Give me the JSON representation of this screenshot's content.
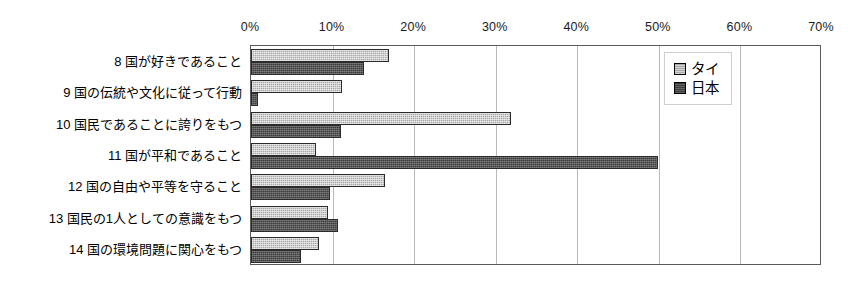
{
  "chart_data": {
    "type": "bar",
    "orientation": "horizontal",
    "title": "",
    "xlabel": "",
    "ylabel": "",
    "xlim": [
      0,
      70
    ],
    "xticks": [
      0,
      10,
      20,
      30,
      40,
      50,
      60,
      70
    ],
    "xtick_labels": [
      "0%",
      "10%",
      "20%",
      "30%",
      "40%",
      "50%",
      "60%",
      "70%"
    ],
    "grid": true,
    "legend_position": "top-right",
    "categories": [
      "8 国が好きであること",
      "9 国の伝統や文化に従って行動",
      "10 国民であることに誇りをもつ",
      "11 国が平和であること",
      "12 国の自由や平等を守ること",
      "13 国民の1人としての意識をもつ",
      "14 国の環境問題に関心をもつ"
    ],
    "series": [
      {
        "name": "タイ",
        "color": "#a8a8a8",
        "values": [
          16.9,
          11.1,
          31.9,
          8.0,
          16.4,
          9.4,
          8.3
        ]
      },
      {
        "name": "日本",
        "color": "#3b3b3b",
        "values": [
          13.8,
          0.8,
          11.0,
          49.9,
          9.7,
          10.7,
          6.1
        ]
      }
    ]
  }
}
